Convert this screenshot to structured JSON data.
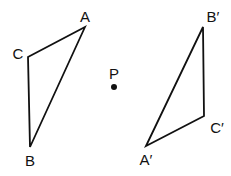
{
  "diagram": {
    "stroke_color": "#111111",
    "background": "#ffffff",
    "triangle_original": {
      "vertices": [
        {
          "name": "A",
          "label": "A",
          "x": 85,
          "y": 27,
          "label_x": 85,
          "label_y": 22
        },
        {
          "name": "B",
          "label": "B",
          "x": 30,
          "y": 147,
          "label_x": 30,
          "label_y": 166
        },
        {
          "name": "C",
          "label": "C",
          "x": 28,
          "y": 57,
          "label_x": 18,
          "label_y": 59
        }
      ]
    },
    "triangle_image": {
      "vertices": [
        {
          "name": "A'",
          "label": "A′",
          "x": 146,
          "y": 146,
          "label_x": 146,
          "label_y": 165
        },
        {
          "name": "B'",
          "label": "B′",
          "x": 203,
          "y": 27,
          "label_x": 213,
          "label_y": 22
        },
        {
          "name": "C'",
          "label": "C′",
          "x": 204,
          "y": 116,
          "label_x": 217,
          "label_y": 133
        }
      ]
    },
    "center": {
      "name": "P",
      "label": "P",
      "x": 114,
      "y": 87,
      "label_x": 114,
      "label_y": 79
    }
  }
}
